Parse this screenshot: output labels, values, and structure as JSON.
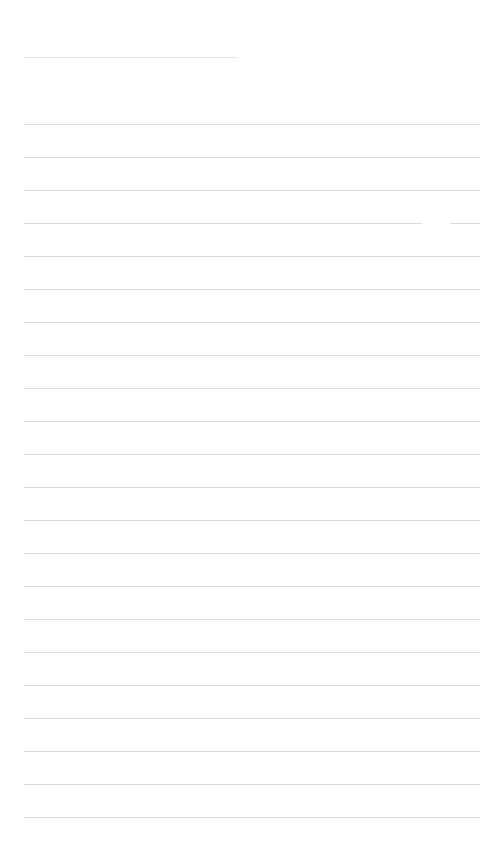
{
  "page": {
    "background": "#ffffff",
    "line_color": "#dcdcdc",
    "title_line": {
      "x": 24,
      "y": 57,
      "width": 213
    },
    "ruled_lines": {
      "count": 22,
      "start_y": 124,
      "spacing": 33,
      "x": 24,
      "width": 456,
      "gaps": [
        {
          "line_index": 3,
          "x_from": 422,
          "x_to": 450
        }
      ]
    }
  }
}
